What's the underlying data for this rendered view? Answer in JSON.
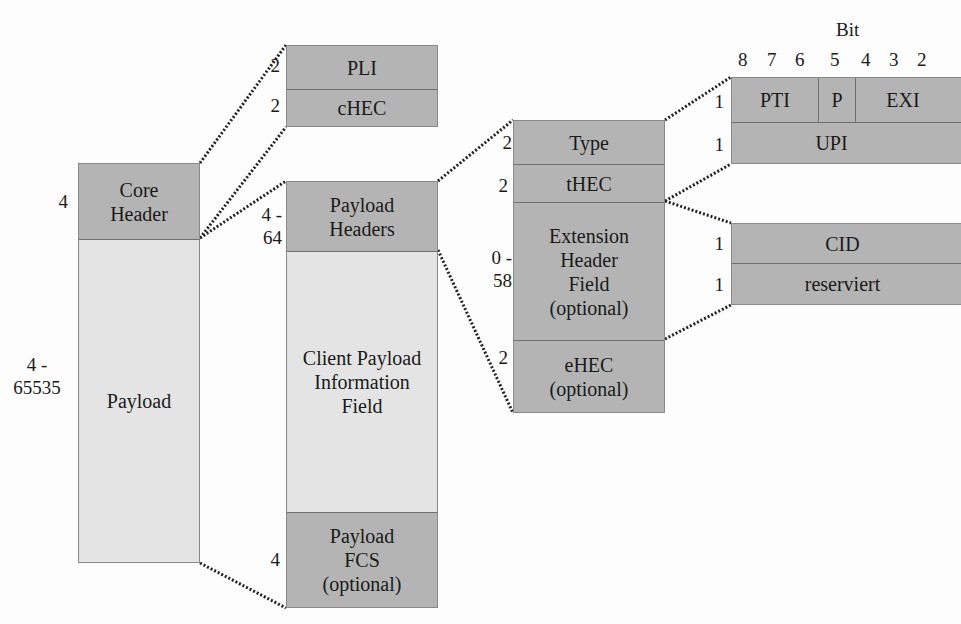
{
  "core_frame": {
    "header": {
      "label": "Core Header",
      "size": "4"
    },
    "payload": {
      "label": "Payload",
      "size": "4 - 65535"
    }
  },
  "core_header_detail": [
    {
      "label": "PLI",
      "size": "2"
    },
    {
      "label": "cHEC",
      "size": "2"
    }
  ],
  "payload_detail": [
    {
      "label": "Payload Headers",
      "size": "4 - 64"
    },
    {
      "label": "Client Payload Information Field",
      "size": ""
    },
    {
      "label": "Payload FCS (optional)",
      "size": "4"
    }
  ],
  "payload_header_detail": [
    {
      "label": "Type",
      "size": "2"
    },
    {
      "label": "tHEC",
      "size": "2"
    },
    {
      "label": "Extension Header Field (optional)",
      "size": "0 - 58"
    },
    {
      "label": "eHEC (optional)",
      "size": "2"
    }
  ],
  "type_field_detail": {
    "bit_title": "Bit",
    "bit_numbers": [
      "8",
      "7",
      "6",
      "5",
      "4",
      "3",
      "2"
    ],
    "rows": [
      {
        "size": "1",
        "fields": [
          "PTI",
          "P",
          "EXI"
        ]
      },
      {
        "size": "1",
        "fields": [
          "UPI"
        ]
      }
    ]
  },
  "extension_header_detail": [
    {
      "label": "CID",
      "size": "1"
    },
    {
      "label": "reserviert",
      "size": "1"
    }
  ],
  "colors": {
    "dark_fill": "#b4b4b4",
    "light_fill": "#e4e4e4",
    "connector": "#222222"
  }
}
